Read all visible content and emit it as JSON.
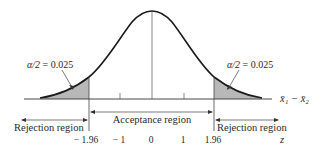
{
  "diagram": {
    "type": "two-tailed hypothesis test, standard normal distribution",
    "axis_label_top": "x̄₁ − x̄₂",
    "axis_label_bottom": "z",
    "left_tail": {
      "label": "α/2 = 0.025",
      "alpha_symbol": "α/2",
      "value": "= 0.025",
      "shaded": true,
      "fill_color": "#b8b8b8"
    },
    "right_tail": {
      "label": "α/2 = 0.025",
      "alpha_symbol": "α/2",
      "value": "= 0.025",
      "shaded": true,
      "fill_color": "#b8b8b8"
    },
    "regions": {
      "left_rejection": "Rejection region",
      "acceptance": "Acceptance region",
      "right_rejection": "Rejection region"
    },
    "z_ticks": [
      {
        "label": "− 1.96",
        "value": -1.96
      },
      {
        "label": "− 1",
        "value": -1
      },
      {
        "label": "0",
        "value": 0
      },
      {
        "label": "1",
        "value": 1
      },
      {
        "label": "1.96",
        "value": 1.96
      }
    ],
    "colors": {
      "curve": "#1a1a1a",
      "shade": "#b8b8b8",
      "line": "#333333",
      "text": "#2a2a2a"
    }
  }
}
